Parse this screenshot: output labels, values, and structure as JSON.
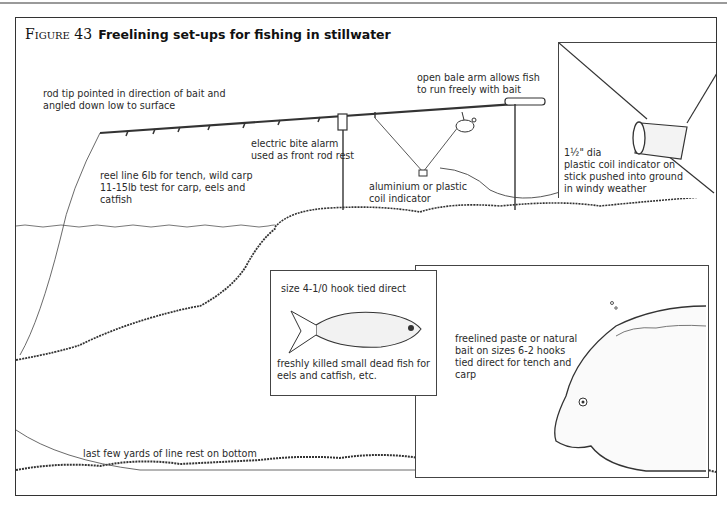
{
  "figure": {
    "number_label": "Figure 43",
    "title": "Freelining set-ups for fishing in stillwater"
  },
  "annotations": {
    "rod_tip": "rod tip pointed in direction of bait and\nangled down low to surface",
    "bale_arm": "open bale arm allows fish\nto run freely with bait",
    "bite_alarm": "electric bite alarm\nused as front rod rest",
    "reel_line": "reel line 6lb for tench, wild carp\n11-15lb test for carp, eels and\ncatfish",
    "coil_indicator": "aluminium or plastic\ncoil indicator",
    "windy_indicator": "1½\" dia\nplastic coil indicator on\nstick pushed into ground\nin windy weather",
    "hook_size": "size 4-1/0 hook tied direct",
    "dead_fish": "freshly killed small dead fish for\neels and catfish, etc.",
    "paste_bait": "freelined paste or natural\nbait on sizes 6-2 hooks\ntied direct for tench and\ncarp",
    "line_bottom": "last few yards of line rest on bottom"
  },
  "insets": [
    {
      "name": "coil-indicator-detail"
    },
    {
      "name": "dead-fish-bait-detail"
    },
    {
      "name": "carp-feeding-detail"
    }
  ],
  "colors": {
    "ink": "#222222",
    "frame": "#333333",
    "background": "#ffffff"
  }
}
